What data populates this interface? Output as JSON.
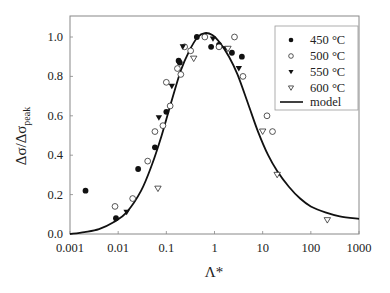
{
  "chart_data": {
    "type": "scatter",
    "title": "",
    "xlabel": "Λ*",
    "ylabel": "Δσ/Δσ_peak",
    "ylabel_main": "Δσ/Δσ",
    "ylabel_sub": "peak",
    "xscale": "log",
    "xlim": [
      0.001,
      1000
    ],
    "ylim": [
      0.0,
      1.1
    ],
    "grid": false,
    "legend_position": "upper right",
    "x_ticks": [
      {
        "value": 0.001,
        "label": "0.001"
      },
      {
        "value": 0.01,
        "label": "0.01"
      },
      {
        "value": 0.1,
        "label": "0.1"
      },
      {
        "value": 1,
        "label": "1"
      },
      {
        "value": 10,
        "label": "10"
      },
      {
        "value": 100,
        "label": "100"
      },
      {
        "value": 1000,
        "label": "1000"
      }
    ],
    "y_ticks": [
      {
        "value": 0.0,
        "label": "0.0"
      },
      {
        "value": 0.2,
        "label": "0.2"
      },
      {
        "value": 0.4,
        "label": "0.4"
      },
      {
        "value": 0.6,
        "label": "0.6"
      },
      {
        "value": 0.8,
        "label": "0.8"
      },
      {
        "value": 1.0,
        "label": "1.0"
      }
    ],
    "series": [
      {
        "name": "450 °C",
        "marker": "filled-circle",
        "points": [
          [
            0.0021,
            0.22
          ],
          [
            0.009,
            0.08
          ],
          [
            0.026,
            0.33
          ],
          [
            0.058,
            0.44
          ],
          [
            0.1,
            0.62
          ],
          [
            0.18,
            0.88
          ],
          [
            0.19,
            0.87
          ],
          [
            0.43,
            1.0
          ],
          [
            0.85,
            0.95
          ],
          [
            1.24,
            0.96
          ],
          [
            2.3,
            0.92
          ],
          [
            3.7,
            0.9
          ]
        ]
      },
      {
        "name": "500 °C",
        "marker": "open-circle",
        "points": [
          [
            0.0086,
            0.14
          ],
          [
            0.02,
            0.18
          ],
          [
            0.041,
            0.37
          ],
          [
            0.058,
            0.52
          ],
          [
            0.085,
            0.55
          ],
          [
            0.12,
            0.65
          ],
          [
            0.1,
            0.77
          ],
          [
            0.17,
            0.84
          ],
          [
            0.2,
            0.81
          ],
          [
            0.24,
            0.95
          ],
          [
            0.32,
            0.93
          ],
          [
            0.63,
            1.0
          ],
          [
            1.24,
            0.95
          ],
          [
            2.6,
            1.0
          ],
          [
            3.9,
            0.8
          ],
          [
            12.3,
            0.6
          ],
          [
            16,
            0.52
          ]
        ]
      },
      {
        "name": "550 °C",
        "marker": "filled-triangle-down",
        "points": [
          [
            0.015,
            0.11
          ],
          [
            0.07,
            0.59
          ],
          [
            0.13,
            0.75
          ],
          [
            0.22,
            0.95
          ],
          [
            0.93,
            0.99
          ],
          [
            1.7,
            0.94
          ],
          [
            3.2,
            0.84
          ]
        ]
      },
      {
        "name": "600 °C",
        "marker": "open-triangle-down",
        "points": [
          [
            0.067,
            0.23
          ],
          [
            0.37,
            0.89
          ],
          [
            1.9,
            0.94
          ],
          [
            10,
            0.52
          ],
          [
            20,
            0.3
          ],
          [
            220,
            0.07
          ]
        ]
      },
      {
        "name": "model",
        "marker": "line",
        "points": [
          [
            0.001,
            0.0
          ],
          [
            0.002,
            0.01
          ],
          [
            0.004,
            0.025
          ],
          [
            0.008,
            0.06
          ],
          [
            0.015,
            0.11
          ],
          [
            0.03,
            0.22
          ],
          [
            0.05,
            0.35
          ],
          [
            0.08,
            0.5
          ],
          [
            0.12,
            0.65
          ],
          [
            0.2,
            0.83
          ],
          [
            0.3,
            0.93
          ],
          [
            0.45,
            1.0
          ],
          [
            0.63,
            1.02
          ],
          [
            0.9,
            1.01
          ],
          [
            1.3,
            0.97
          ],
          [
            2.0,
            0.9
          ],
          [
            3.0,
            0.81
          ],
          [
            5.0,
            0.66
          ],
          [
            8.0,
            0.52
          ],
          [
            13,
            0.4
          ],
          [
            20,
            0.32
          ],
          [
            35,
            0.24
          ],
          [
            60,
            0.18
          ],
          [
            100,
            0.14
          ],
          [
            200,
            0.11
          ],
          [
            400,
            0.09
          ],
          [
            1000,
            0.077
          ]
        ]
      }
    ]
  },
  "legend": {
    "items": [
      {
        "label": "450 °C",
        "marker": "filled-circle"
      },
      {
        "label": "500 °C",
        "marker": "open-circle"
      },
      {
        "label": "550 °C",
        "marker": "filled-triangle-down"
      },
      {
        "label": "600 °C",
        "marker": "open-triangle-down"
      },
      {
        "label": "model",
        "marker": "line"
      }
    ]
  },
  "colors": {
    "axis": "#888888",
    "marker": "#111111",
    "line": "#111111",
    "text": "#222222",
    "background": "#ffffff"
  }
}
